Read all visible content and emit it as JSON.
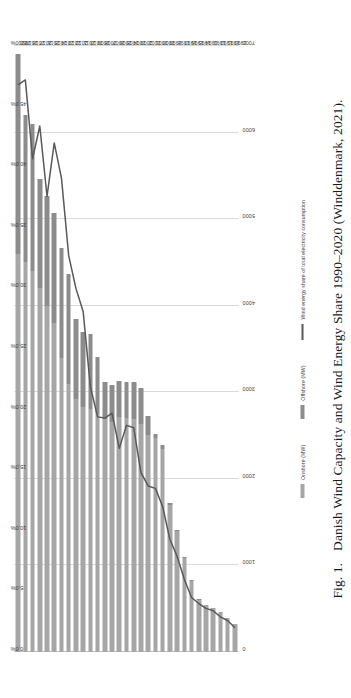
{
  "figure": {
    "caption_label": "Fig. 1.",
    "caption_text": "Danish Wind Capacity and Wind Energy Share 1990–2020 (Winddenmark, 2021)."
  },
  "legend": {
    "position": "bottom-center",
    "items": [
      {
        "name": "onshore",
        "label": "Onshore (MW)",
        "marker": "bar",
        "color": "#a6a6a6"
      },
      {
        "name": "offshore",
        "label": "Offshore (MW)",
        "marker": "bar",
        "color": "#8c8c8c"
      },
      {
        "name": "share",
        "label": "Wind energy share of total electricity consumption",
        "marker": "line",
        "color": "#595959"
      }
    ]
  },
  "axes": {
    "capacity": {
      "title": "",
      "unit": "MW",
      "ticks": [
        "0",
        "1000",
        "2000",
        "3000",
        "4000",
        "5000",
        "6000",
        "7000"
      ],
      "min": 0,
      "max": 7000
    },
    "share": {
      "title": "",
      "unit": "%",
      "ticks": [
        "0,0%",
        "5,0%",
        "10,0%",
        "15,0%",
        "20,0%",
        "25,0%",
        "30,0%",
        "35,0%",
        "40,0%",
        "45,0%",
        "50,0%"
      ],
      "min": 0,
      "max": 50
    }
  },
  "chart_data": {
    "type": "bar",
    "title": "Danish Wind Capacity and Wind Energy Share 1990–2020",
    "xlabel": "",
    "ylabel": "MW",
    "y2label": "%",
    "ylim": [
      0,
      7000
    ],
    "y2lim": [
      0,
      50
    ],
    "grid": true,
    "legend_position": "bottom",
    "orientation": "bars-horizontal-rotated",
    "categories": [
      "1990",
      "1991",
      "1992",
      "1993",
      "1994",
      "1995",
      "1996",
      "1997",
      "1998",
      "1999",
      "2000",
      "2001",
      "2002",
      "2003",
      "2004",
      "2005",
      "2006",
      "2007",
      "2008",
      "2009",
      "2010",
      "2011",
      "2012",
      "2013",
      "2014",
      "2015",
      "2016",
      "2017",
      "2018",
      "2019",
      "2020"
    ],
    "series": [
      {
        "name": "Onshore (MW)",
        "type": "bar",
        "stack": "capacity",
        "axis": "left",
        "color": "#a6a6a6",
        "values": [
          326,
          393,
          458,
          506,
          539,
          604,
          820,
          1090,
          1392,
          1700,
          2340,
          2470,
          2510,
          2630,
          2690,
          2700,
          2710,
          2660,
          2690,
          2750,
          2810,
          2830,
          2920,
          3100,
          3400,
          3800,
          4000,
          4200,
          4400,
          4500,
          4600
        ]
      },
      {
        "name": "Offshore (MW)",
        "type": "bar",
        "stack": "capacity",
        "axis": "left",
        "color": "#8c8c8c",
        "values": [
          0,
          0,
          0,
          0,
          0,
          5,
          5,
          5,
          23,
          23,
          50,
          50,
          214,
          424,
          424,
          424,
          424,
          424,
          424,
          660,
          868,
          871,
          921,
          1271,
          1271,
          1271,
          1271,
          1266,
          1701,
          1701,
          2306
        ]
      },
      {
        "name": "Wind energy share of total electricity consumption",
        "type": "line",
        "axis": "right",
        "color": "#595959",
        "values": [
          2.0,
          2.6,
          2.9,
          3.4,
          3.6,
          4.0,
          4.5,
          6.0,
          7.9,
          9.3,
          12.0,
          13.5,
          13.7,
          14.8,
          18.5,
          18.7,
          16.8,
          19.7,
          19.3,
          19.4,
          21.9,
          28.1,
          30.0,
          32.7,
          39.1,
          42.0,
          37.6,
          43.4,
          40.7,
          47.2,
          46.8
        ]
      }
    ]
  }
}
